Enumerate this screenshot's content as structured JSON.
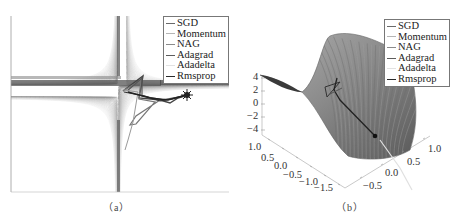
{
  "chart_data": [
    {
      "panel": "a",
      "type": "contour",
      "title": "",
      "caption": "（a）",
      "xlabel": "",
      "ylabel": "",
      "grid": false,
      "legend_position": "upper right",
      "legend": [
        "SGD",
        "Momentum",
        "NAG",
        "Adagrad",
        "Adadelta",
        "Rmsprop"
      ],
      "description": "Contour plot of saddle function with optimizer trajectories starting near saddle center and moving to the right",
      "series": [
        {
          "name": "SGD",
          "color": "#6a6a6a"
        },
        {
          "name": "Momentum",
          "color": "#b0b0b0"
        },
        {
          "name": "NAG",
          "color": "#8a8a8a"
        },
        {
          "name": "Adagrad",
          "color": "#5c5c5c"
        },
        {
          "name": "Adadelta",
          "color": "#d8d8d8"
        },
        {
          "name": "Rmsprop",
          "color": "#2a2a2a"
        }
      ]
    },
    {
      "panel": "b",
      "type": "surface3d",
      "title": "",
      "caption": "（b）",
      "legend_position": "upper right",
      "legend": [
        "SGD",
        "Momentum",
        "NAG",
        "Adagrad",
        "Adadelta",
        "Rmsprop"
      ],
      "z_ticks": [
        "4",
        "2",
        "0",
        "−2",
        "−4"
      ],
      "x_ticks": [
        "1.0",
        "0.5",
        "0.0",
        "−0.5",
        "−1.0",
        "−1.5"
      ],
      "y_ticks": [
        "−0.5",
        "0.0",
        "0.5",
        "1.0"
      ],
      "zlim": [
        -4,
        4
      ],
      "xlim": [
        -1.5,
        1.0
      ],
      "ylim": [
        -0.5,
        1.0
      ],
      "series": [
        {
          "name": "SGD",
          "color": "#6a6a6a"
        },
        {
          "name": "Momentum",
          "color": "#b0b0b0"
        },
        {
          "name": "NAG",
          "color": "#8a8a8a"
        },
        {
          "name": "Adagrad",
          "color": "#5c5c5c"
        },
        {
          "name": "Adadelta",
          "color": "#d8d8d8"
        },
        {
          "name": "Rmsprop",
          "color": "#2a2a2a"
        }
      ]
    }
  ],
  "panel_a": {
    "caption": "（a）",
    "legend": [
      {
        "label": "SGD",
        "color": "#6a6a6a"
      },
      {
        "label": "Momentum",
        "color": "#b5b5b5"
      },
      {
        "label": "NAG",
        "color": "#8a8a8a"
      },
      {
        "label": "Adagrad",
        "color": "#5c5c5c"
      },
      {
        "label": "Adadelta",
        "color": "#e2e2e2"
      },
      {
        "label": "Rmsprop",
        "color": "#2a2a2a"
      }
    ]
  },
  "panel_b": {
    "caption": "（b）",
    "legend": [
      {
        "label": "SGD",
        "color": "#6a6a6a"
      },
      {
        "label": "Momentum",
        "color": "#b5b5b5"
      },
      {
        "label": "NAG",
        "color": "#8a8a8a"
      },
      {
        "label": "Adagrad",
        "color": "#5c5c5c"
      },
      {
        "label": "Adadelta",
        "color": "#e2e2e2"
      },
      {
        "label": "Rmsprop",
        "color": "#2a2a2a"
      }
    ],
    "z_ticks": [
      "4",
      "2",
      "0",
      "−2",
      "−4"
    ],
    "x_ticks": [
      "1.0",
      "0.5",
      "0.0",
      "−0.5",
      "−1.0",
      "−1.5"
    ],
    "y_ticks": [
      "−0.5",
      "0.0",
      "0.5",
      "1.0"
    ]
  }
}
